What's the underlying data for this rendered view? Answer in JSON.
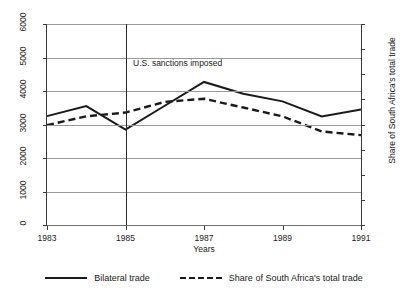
{
  "chart_data": {
    "type": "line",
    "title": "",
    "xlabel": "Years",
    "ylabel": "Trade flow in millions of U.S. dollars",
    "ylabel_right": "Share of South Africa's total trade",
    "x": [
      1983,
      1984,
      1985,
      1986,
      1987,
      1988,
      1989,
      1990,
      1991
    ],
    "xlim": [
      1983,
      1991
    ],
    "ylim": [
      0,
      6000
    ],
    "ylim_right": [
      0,
      0.16
    ],
    "xticks": [
      "1983",
      "1985",
      "1987",
      "1989",
      "1991"
    ],
    "xtick_values": [
      1983,
      1985,
      1987,
      1989,
      1991
    ],
    "yticks_left": [
      "0",
      "1000",
      "2000",
      "3000",
      "4000",
      "5000",
      "6000"
    ],
    "ytick_values_left": [
      0,
      1000,
      2000,
      3000,
      4000,
      5000,
      6000
    ],
    "yticks_right": [
      "0",
      ".02",
      ".04",
      ".06",
      ".08",
      ".1",
      ".12",
      ".14",
      ".16"
    ],
    "ytick_values_right": [
      0,
      0.02,
      0.04,
      0.06,
      0.08,
      0.1,
      0.12,
      0.14,
      0.16
    ],
    "grid": true,
    "legend_position": "bottom",
    "series": [
      {
        "name": "Bilateral trade",
        "axis": "left",
        "style": "solid",
        "color": "#1a1a1a",
        "values": [
          3250,
          3550,
          2850,
          3560,
          4270,
          3920,
          3690,
          3240,
          3450
        ]
      },
      {
        "name": "Share of South Africa's total trade",
        "axis": "right",
        "style": "dashed",
        "color": "#1a1a1a",
        "values": [
          0.0795,
          0.0865,
          0.0895,
          0.098,
          0.1005,
          0.0935,
          0.0865,
          0.0745,
          0.0715
        ]
      }
    ],
    "annotations": [
      {
        "text": "U.S. sanctions imposed",
        "x": 1985,
        "type": "vertical-line-label"
      }
    ],
    "reference_lines": [
      {
        "x": 1985,
        "orientation": "vertical",
        "color": "#2a2a2a"
      }
    ]
  },
  "legend": {
    "items": [
      {
        "label": "Bilateral trade",
        "style": "solid"
      },
      {
        "label": "Share of South Africa's total trade",
        "style": "dashed"
      }
    ]
  }
}
